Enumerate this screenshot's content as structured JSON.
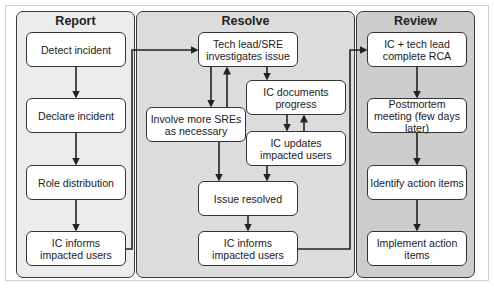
{
  "diagram": {
    "type": "incident-management-flowchart",
    "colors": {
      "report_panel": "#ececec",
      "resolve_panel": "#dcdcdc",
      "review_panel": "#cdcdcd",
      "node_fill": "#ffffff",
      "stroke": "#222222"
    },
    "panels": {
      "report": {
        "title": "Report",
        "nodes": {
          "detect": "Detect incident",
          "declare": "Declare incident",
          "roles": "Role distribution",
          "inform": "IC informs impacted users"
        }
      },
      "resolve": {
        "title": "Resolve",
        "nodes": {
          "investigate": "Tech lead/SRE investigates issue",
          "involve": "Involve more SREs as necessary",
          "documents": "IC documents progress",
          "updates": "IC updates impacted users",
          "resolved": "Issue resolved",
          "inform": "IC informs impacted users"
        }
      },
      "review": {
        "title": "Review",
        "nodes": {
          "rca": "IC + tech lead complete RCA",
          "postmortem": "Postmortem meeting (few days later)",
          "identify": "Identify action items",
          "implement": "Implement action items"
        }
      }
    },
    "edges": [
      [
        "Detect incident",
        "Declare incident"
      ],
      [
        "Declare incident",
        "Role distribution"
      ],
      [
        "Role distribution",
        "IC informs impacted users"
      ],
      [
        "IC informs impacted users (Report)",
        "Tech lead/SRE investigates issue"
      ],
      [
        "Tech lead/SRE investigates issue",
        "Involve more SREs as necessary"
      ],
      [
        "Involve more SREs as necessary",
        "Tech lead/SRE investigates issue"
      ],
      [
        "Tech lead/SRE investigates issue",
        "IC documents progress"
      ],
      [
        "IC documents progress",
        "IC updates impacted users"
      ],
      [
        "IC updates impacted users",
        "IC documents progress"
      ],
      [
        "Involve more SREs as necessary",
        "Issue resolved"
      ],
      [
        "IC updates impacted users",
        "Issue resolved"
      ],
      [
        "Issue resolved",
        "IC informs impacted users (Resolve)"
      ],
      [
        "IC informs impacted users (Resolve)",
        "IC + tech lead complete RCA"
      ],
      [
        "IC + tech lead complete RCA",
        "Postmortem meeting (few days later)"
      ],
      [
        "Postmortem meeting (few days later)",
        "Identify action items"
      ],
      [
        "Identify action items",
        "Implement action items"
      ]
    ]
  }
}
